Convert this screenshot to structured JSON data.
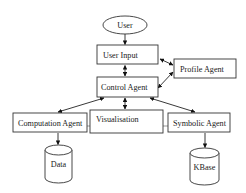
{
  "diagram": {
    "type": "agent-architecture-flow",
    "nodes": [
      {
        "id": "user",
        "label": "User",
        "shape": "ellipse"
      },
      {
        "id": "user_input",
        "label": "User Input",
        "shape": "rect"
      },
      {
        "id": "profile_agent",
        "label": "Profile Agent",
        "shape": "rect"
      },
      {
        "id": "control_agent",
        "label": "Control Agent",
        "shape": "rect"
      },
      {
        "id": "computation_agent",
        "label": "Computation Agent",
        "shape": "rect"
      },
      {
        "id": "visualisation",
        "label": "Visualisation",
        "shape": "rect"
      },
      {
        "id": "symbolic_agent",
        "label": "Symbolic Agent",
        "shape": "rect"
      },
      {
        "id": "data",
        "label": "Data",
        "shape": "cylinder"
      },
      {
        "id": "kbase",
        "label": "KBase",
        "shape": "cylinder"
      }
    ],
    "edges": [
      {
        "from": "user",
        "to": "user_input",
        "direction": "forward"
      },
      {
        "from": "user_input",
        "to": "control_agent",
        "direction": "both"
      },
      {
        "from": "user_input",
        "to": "profile_agent",
        "direction": "both"
      },
      {
        "from": "profile_agent",
        "to": "control_agent",
        "direction": "both"
      },
      {
        "from": "control_agent",
        "to": "computation_agent",
        "direction": "both"
      },
      {
        "from": "control_agent",
        "to": "visualisation",
        "direction": "both"
      },
      {
        "from": "control_agent",
        "to": "symbolic_agent",
        "direction": "both"
      },
      {
        "from": "computation_agent",
        "to": "visualisation",
        "direction": "none"
      },
      {
        "from": "visualisation",
        "to": "symbolic_agent",
        "direction": "none"
      },
      {
        "from": "computation_agent",
        "to": "data",
        "direction": "forward"
      },
      {
        "from": "symbolic_agent",
        "to": "kbase",
        "direction": "forward"
      }
    ]
  },
  "labels": {
    "user": "User",
    "user_input": "User Input",
    "profile_agent": "Profile Agent",
    "control_agent": "Control Agent",
    "computation_agent": "Computation Agent",
    "visualisation": "Visualisation",
    "symbolic_agent": "Symbolic Agent",
    "data": "Data",
    "kbase": "KBase"
  }
}
